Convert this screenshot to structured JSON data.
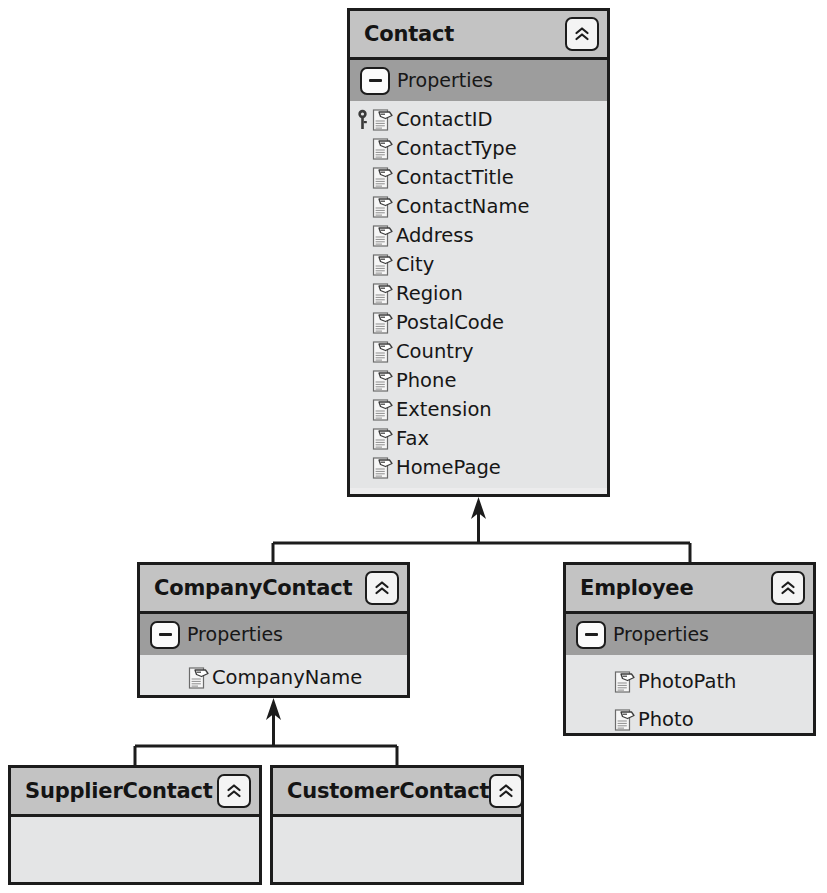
{
  "diagram": {
    "type": "uml-class-diagram",
    "colors": {
      "border": "#1c1c1c",
      "title_band": "#c3c3c3",
      "properties_band": "#9d9d9d",
      "body": "#e4e5e6",
      "page_background": "#ffffff",
      "text": "#161616"
    },
    "classes": [
      {
        "id": "contact",
        "name": "Contact",
        "collapse_icon": "double-chevron-up-icon",
        "section_label": "Properties",
        "section_toggle_icon": "minus-icon",
        "properties": [
          {
            "name": "ContactID",
            "icon": "property-icon",
            "key": true
          },
          {
            "name": "ContactType",
            "icon": "property-icon",
            "key": false
          },
          {
            "name": "ContactTitle",
            "icon": "property-icon",
            "key": false
          },
          {
            "name": "ContactName",
            "icon": "property-icon",
            "key": false
          },
          {
            "name": "Address",
            "icon": "property-icon",
            "key": false
          },
          {
            "name": "City",
            "icon": "property-icon",
            "key": false
          },
          {
            "name": "Region",
            "icon": "property-icon",
            "key": false
          },
          {
            "name": "PostalCode",
            "icon": "property-icon",
            "key": false
          },
          {
            "name": "Country",
            "icon": "property-icon",
            "key": false
          },
          {
            "name": "Phone",
            "icon": "property-icon",
            "key": false
          },
          {
            "name": "Extension",
            "icon": "property-icon",
            "key": false
          },
          {
            "name": "Fax",
            "icon": "property-icon",
            "key": false
          },
          {
            "name": "HomePage",
            "icon": "property-icon",
            "key": false
          }
        ]
      },
      {
        "id": "companycontact",
        "name": "CompanyContact",
        "collapse_icon": "double-chevron-up-icon",
        "section_label": "Properties",
        "section_toggle_icon": "minus-icon",
        "properties": [
          {
            "name": "CompanyName",
            "icon": "property-icon",
            "key": false
          }
        ]
      },
      {
        "id": "employee",
        "name": "Employee",
        "collapse_icon": "double-chevron-up-icon",
        "section_label": "Properties",
        "section_toggle_icon": "minus-icon",
        "properties": [
          {
            "name": "PhotoPath",
            "icon": "property-icon",
            "key": false
          },
          {
            "name": "Photo",
            "icon": "property-icon",
            "key": false
          }
        ]
      },
      {
        "id": "suppliercontact",
        "name": "SupplierContact",
        "collapse_icon": "double-chevron-up-icon",
        "section_label": "",
        "properties": []
      },
      {
        "id": "customercontact",
        "name": "CustomerContact",
        "collapse_icon": "double-chevron-up-icon",
        "section_label": "",
        "properties": []
      }
    ],
    "relationships": [
      {
        "type": "inheritance",
        "child": "companycontact",
        "parent": "contact"
      },
      {
        "type": "inheritance",
        "child": "employee",
        "parent": "contact"
      },
      {
        "type": "inheritance",
        "child": "suppliercontact",
        "parent": "companycontact"
      },
      {
        "type": "inheritance",
        "child": "customercontact",
        "parent": "companycontact"
      }
    ]
  }
}
